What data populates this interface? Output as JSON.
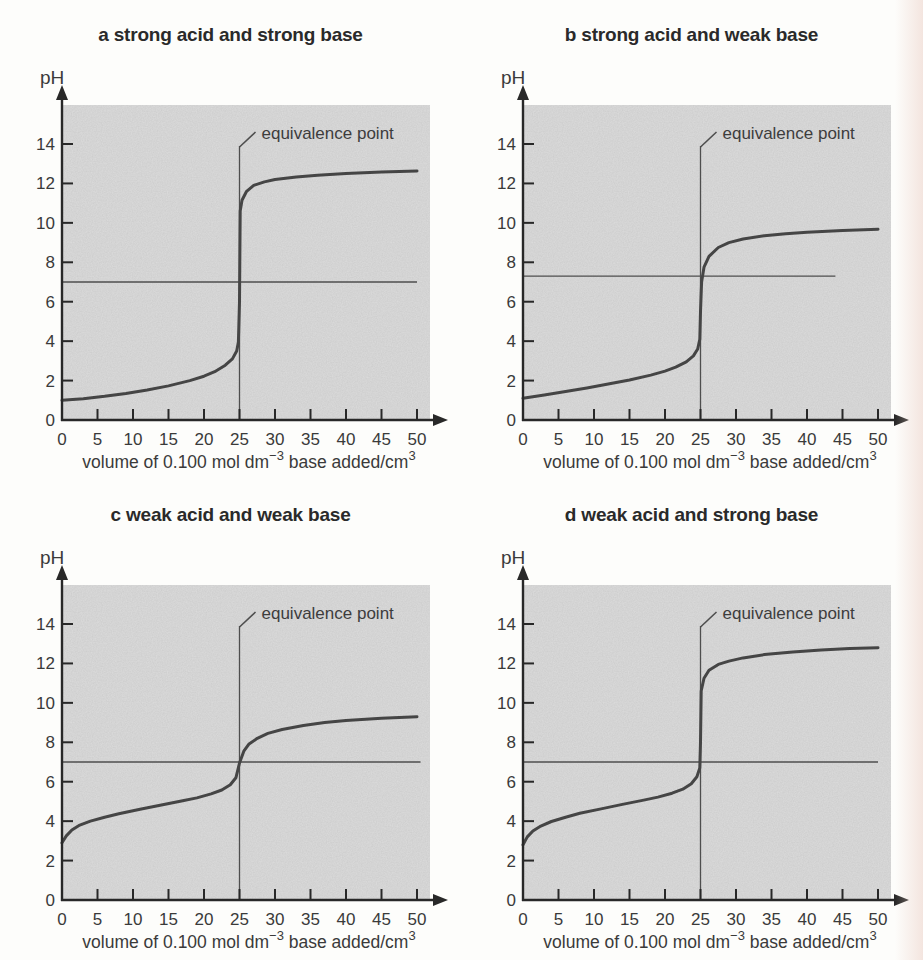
{
  "page": {
    "background": "#fdfdfb",
    "edge_band_color": "#ecd1c8"
  },
  "style": {
    "plot_bg": "#dcdcdc",
    "curve_color": "#454545",
    "axis_color": "#282828",
    "thin_line_color": "#4e4e4e",
    "text_color": "#3a3a3a",
    "title_color": "#2a2a2a"
  },
  "shared": {
    "ylabel": "pH",
    "xlabel": "volume of 0.100 mol dm⁻³ base added/cm³",
    "xlabel_main1": "volume of 0.100 mol dm",
    "xlabel_sup1": "−3",
    "xlabel_main2": " base added/cm",
    "xlabel_sup2": "3",
    "annotation": "equivalence point"
  },
  "chart_data": [
    {
      "type": "line",
      "title": "a strong acid and strong base",
      "ylabel": "pH",
      "xlabel": "volume of 0.100 mol dm⁻³ base added/cm³",
      "annotation": "equivalence point",
      "x_ticks": [
        0,
        5,
        10,
        15,
        20,
        25,
        30,
        35,
        40,
        45,
        50
      ],
      "y_ticks": [
        0,
        2,
        4,
        6,
        8,
        10,
        12,
        14
      ],
      "xlim": [
        0,
        52
      ],
      "ylim": [
        0,
        16
      ],
      "grid": false,
      "equivalence_x": 25,
      "ref_line": {
        "ph": 7,
        "x_start": 0,
        "x_end": 50
      },
      "curve": [
        [
          0,
          1.0
        ],
        [
          3,
          1.08
        ],
        [
          6,
          1.2
        ],
        [
          9,
          1.35
        ],
        [
          12,
          1.52
        ],
        [
          15,
          1.73
        ],
        [
          18,
          2.0
        ],
        [
          20,
          2.22
        ],
        [
          21.5,
          2.45
        ],
        [
          23,
          2.78
        ],
        [
          24,
          3.1
        ],
        [
          24.6,
          3.5
        ],
        [
          24.85,
          3.95
        ],
        [
          25,
          6.0
        ],
        [
          25.1,
          10.6
        ],
        [
          25.35,
          11.15
        ],
        [
          26,
          11.6
        ],
        [
          27,
          11.9
        ],
        [
          28.5,
          12.08
        ],
        [
          30,
          12.2
        ],
        [
          33,
          12.33
        ],
        [
          36,
          12.42
        ],
        [
          40,
          12.5
        ],
        [
          45,
          12.58
        ],
        [
          50,
          12.63
        ]
      ]
    },
    {
      "type": "line",
      "title": "b strong acid and weak base",
      "ylabel": "pH",
      "xlabel": "volume of 0.100 mol dm⁻³ base added/cm³",
      "annotation": "equivalence point",
      "x_ticks": [
        0,
        5,
        10,
        15,
        20,
        25,
        30,
        35,
        40,
        45,
        50
      ],
      "y_ticks": [
        0,
        2,
        4,
        6,
        8,
        10,
        12,
        14
      ],
      "xlim": [
        0,
        52
      ],
      "ylim": [
        0,
        16
      ],
      "grid": false,
      "equivalence_x": 25,
      "ref_line": {
        "ph": 7.3,
        "x_start": 0,
        "x_end": 44
      },
      "curve": [
        [
          0,
          1.1
        ],
        [
          3,
          1.27
        ],
        [
          6,
          1.45
        ],
        [
          9,
          1.63
        ],
        [
          12,
          1.82
        ],
        [
          15,
          2.03
        ],
        [
          18,
          2.28
        ],
        [
          20,
          2.48
        ],
        [
          21.5,
          2.68
        ],
        [
          23,
          2.95
        ],
        [
          24,
          3.25
        ],
        [
          24.6,
          3.6
        ],
        [
          24.9,
          4.1
        ],
        [
          25,
          5.5
        ],
        [
          25.15,
          7.0
        ],
        [
          25.5,
          7.75
        ],
        [
          26.2,
          8.3
        ],
        [
          27.5,
          8.75
        ],
        [
          29,
          9.0
        ],
        [
          31,
          9.18
        ],
        [
          34,
          9.35
        ],
        [
          37,
          9.45
        ],
        [
          40,
          9.52
        ],
        [
          45,
          9.62
        ],
        [
          50,
          9.68
        ]
      ]
    },
    {
      "type": "line",
      "title": "c weak acid and weak base",
      "ylabel": "pH",
      "xlabel": "volume of 0.100 mol dm⁻³ base added/cm³",
      "annotation": "equivalence point",
      "x_ticks": [
        0,
        5,
        10,
        15,
        20,
        25,
        30,
        35,
        40,
        45,
        50
      ],
      "y_ticks": [
        0,
        2,
        4,
        6,
        8,
        10,
        12,
        14
      ],
      "xlim": [
        0,
        52
      ],
      "ylim": [
        0,
        16
      ],
      "grid": false,
      "equivalence_x": 25,
      "ref_line": {
        "ph": 7,
        "x_start": 0,
        "x_end": 50.5
      },
      "curve": [
        [
          0,
          2.9
        ],
        [
          0.6,
          3.25
        ],
        [
          1.4,
          3.55
        ],
        [
          2.5,
          3.8
        ],
        [
          4,
          4.0
        ],
        [
          6,
          4.2
        ],
        [
          8,
          4.37
        ],
        [
          11,
          4.6
        ],
        [
          14,
          4.82
        ],
        [
          17,
          5.03
        ],
        [
          19,
          5.18
        ],
        [
          21,
          5.38
        ],
        [
          22.5,
          5.58
        ],
        [
          23.7,
          5.85
        ],
        [
          24.5,
          6.2
        ],
        [
          25,
          6.95
        ],
        [
          25.6,
          7.55
        ],
        [
          26.3,
          7.9
        ],
        [
          27.5,
          8.2
        ],
        [
          29,
          8.45
        ],
        [
          31,
          8.65
        ],
        [
          34,
          8.85
        ],
        [
          37,
          9.0
        ],
        [
          40,
          9.1
        ],
        [
          45,
          9.22
        ],
        [
          50,
          9.3
        ]
      ]
    },
    {
      "type": "line",
      "title": "d weak acid and strong base",
      "ylabel": "pH",
      "xlabel": "volume of 0.100 mol dm⁻³ base added/cm³",
      "annotation": "equivalence point",
      "x_ticks": [
        0,
        5,
        10,
        15,
        20,
        25,
        30,
        35,
        40,
        45,
        50
      ],
      "y_ticks": [
        0,
        2,
        4,
        6,
        8,
        10,
        12,
        14
      ],
      "xlim": [
        0,
        52
      ],
      "ylim": [
        0,
        16
      ],
      "grid": false,
      "equivalence_x": 25,
      "ref_line": {
        "ph": 7,
        "x_start": 0,
        "x_end": 50
      },
      "curve": [
        [
          0,
          2.8
        ],
        [
          0.6,
          3.2
        ],
        [
          1.4,
          3.5
        ],
        [
          2.5,
          3.75
        ],
        [
          4,
          3.98
        ],
        [
          6,
          4.2
        ],
        [
          8,
          4.4
        ],
        [
          11,
          4.62
        ],
        [
          14,
          4.85
        ],
        [
          17,
          5.07
        ],
        [
          19,
          5.22
        ],
        [
          21,
          5.42
        ],
        [
          22.5,
          5.62
        ],
        [
          23.7,
          5.9
        ],
        [
          24.5,
          6.25
        ],
        [
          24.9,
          6.7
        ],
        [
          25,
          8.0
        ],
        [
          25.1,
          10.6
        ],
        [
          25.5,
          11.25
        ],
        [
          26.2,
          11.65
        ],
        [
          27.5,
          11.95
        ],
        [
          29,
          12.12
        ],
        [
          31,
          12.28
        ],
        [
          34,
          12.45
        ],
        [
          38,
          12.58
        ],
        [
          42,
          12.68
        ],
        [
          46,
          12.75
        ],
        [
          50,
          12.8
        ]
      ]
    }
  ]
}
